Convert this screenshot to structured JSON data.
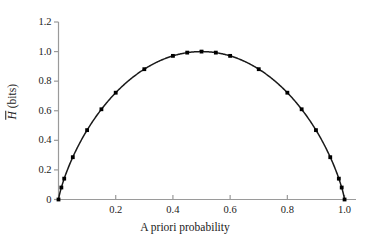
{
  "chart_data": {
    "type": "line",
    "title": "",
    "subtitle": "",
    "xlabel": "A priori probability",
    "ylabel": "H̄ (bits)",
    "ylabel_symbol": "H",
    "ylabel_units": "(bits)",
    "xlim": [
      0.0,
      1.04
    ],
    "ylim": [
      0.0,
      1.2
    ],
    "xticks": [
      0.2,
      0.4,
      0.6,
      0.8,
      1.0
    ],
    "xticklabels": [
      "0.2",
      "0.4",
      "0.6",
      "0.8",
      "1.0"
    ],
    "yticks": [
      0.0,
      0.2,
      0.4,
      0.6,
      0.8,
      1.0,
      1.2
    ],
    "yticklabels": [
      "0",
      "0.2",
      "0.4",
      "0.6",
      "0.8",
      "1.0",
      "1.2"
    ],
    "grid": false,
    "legend": false,
    "legend_position": "none",
    "marker": "square",
    "marker_color": "#000000",
    "line_color": "#1a1a1a",
    "axis_color": "#9a9a9a",
    "background_color": "#ffffff",
    "series": [
      {
        "name": "binary entropy",
        "x": [
          0.0,
          0.01,
          0.02,
          0.05,
          0.1,
          0.15,
          0.2,
          0.3,
          0.4,
          0.45,
          0.5,
          0.55,
          0.6,
          0.7,
          0.8,
          0.85,
          0.9,
          0.95,
          0.98,
          0.99,
          1.0
        ],
        "values": [
          0.0,
          0.081,
          0.141,
          0.286,
          0.469,
          0.61,
          0.722,
          0.881,
          0.971,
          0.993,
          1.0,
          0.993,
          0.971,
          0.881,
          0.722,
          0.61,
          0.469,
          0.286,
          0.141,
          0.081,
          0.0
        ]
      }
    ]
  }
}
